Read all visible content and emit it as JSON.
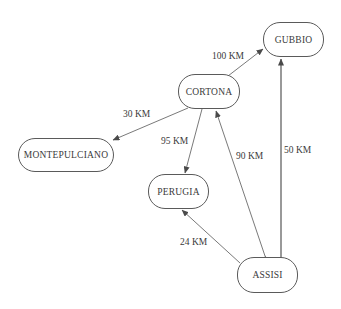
{
  "diagram": {
    "type": "directed-graph",
    "nodes": [
      {
        "id": "gubbio",
        "label": "GUBBIO"
      },
      {
        "id": "cortona",
        "label": "CORTONA"
      },
      {
        "id": "montepulciano",
        "label": "MONTEPULCIANO"
      },
      {
        "id": "perugia",
        "label": "PERUGIA"
      },
      {
        "id": "assisi",
        "label": "ASSISI"
      }
    ],
    "edges": [
      {
        "from": "CORTONA",
        "to": "GUBBIO",
        "label": "100 KM"
      },
      {
        "from": "CORTONA",
        "to": "MONTEPULCIANO",
        "label": "30 KM"
      },
      {
        "from": "CORTONA",
        "to": "PERUGIA",
        "label": "95 KM"
      },
      {
        "from": "ASSISI",
        "to": "CORTONA",
        "label": "90 KM",
        "bidirectional": true
      },
      {
        "from": "ASSISI",
        "to": "GUBBIO",
        "label": "50 KM"
      },
      {
        "from": "ASSISI",
        "to": "PERUGIA",
        "label": "24 KM"
      }
    ],
    "colors": {
      "stroke": "#5a5a5a",
      "text": "#3a3a3a",
      "background": "#ffffff"
    }
  }
}
